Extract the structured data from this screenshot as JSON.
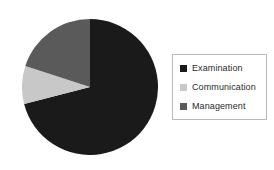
{
  "chart_data": {
    "type": "pie",
    "title": "",
    "subtitle": "",
    "xlabel": "",
    "ylabel": "",
    "grid": false,
    "legend_position": "right",
    "start_angle_deg": 0,
    "direction": "clockwise",
    "categories": [
      "Examination",
      "Communication",
      "Management"
    ],
    "values": [
      71,
      9,
      20
    ],
    "units": "%",
    "colors": [
      "#1a1a1a",
      "#c8c8c8",
      "#5a5a5a"
    ],
    "slices": [
      {
        "label": "Examination",
        "value": 71,
        "color": "#1a1a1a",
        "start_deg": 0,
        "end_deg": 255.6
      },
      {
        "label": "Communication",
        "value": 9,
        "color": "#c8c8c8",
        "start_deg": 255.6,
        "end_deg": 288.0
      },
      {
        "label": "Management",
        "value": 20,
        "color": "#5a5a5a",
        "start_deg": 288.0,
        "end_deg": 360
      }
    ]
  },
  "legend": {
    "border_color": "#b9b9b9",
    "background": "#ffffff",
    "items": [
      {
        "label": "Examination",
        "color": "#1a1a1a",
        "swatch_name": "legend-swatch-examination"
      },
      {
        "label": "Communication",
        "color": "#c8c8c8",
        "swatch_name": "legend-swatch-communication"
      },
      {
        "label": "Management",
        "color": "#5a5a5a",
        "swatch_name": "legend-swatch-management"
      }
    ]
  },
  "figure": {
    "background": "#ffffff"
  }
}
